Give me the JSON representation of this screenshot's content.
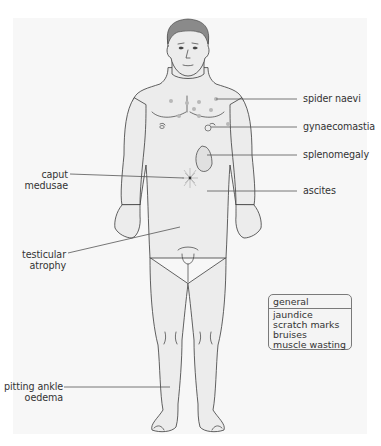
{
  "figure": {
    "colors": {
      "panel_background": "#f7f7f7",
      "skin": "#ececec",
      "outline": "#3a3a3a",
      "hair": "#8a8a8a",
      "leader_line": "#555555",
      "spider_naevi": "#b8b8b8"
    }
  },
  "labels": {
    "spider_naevi": "spider naevi",
    "gynaecomastia": "gynaecomastia",
    "splenomegaly": "splenomegaly",
    "ascites": "ascites",
    "caput_medusae_line1": "caput",
    "caput_medusae_line2": "medusae",
    "testicular_atrophy_line1": "testicular",
    "testicular_atrophy_line2": "atrophy",
    "pitting_ankle_oedema_line1": "pitting ankle",
    "pitting_ankle_oedema_line2": "oedema"
  },
  "general_box": {
    "title": "general",
    "items": [
      "jaundice",
      "scratch marks",
      "bruises",
      "muscle wasting"
    ]
  }
}
